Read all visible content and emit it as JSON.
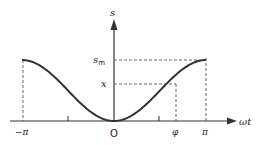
{
  "diagram": {
    "axes": {
      "y_label": "s",
      "x_label": "ωt",
      "origin_label": "O"
    },
    "x_ticks": [
      {
        "label": "−π",
        "pos": -3.14159
      },
      {
        "label": "φ",
        "pos": 2.5
      },
      {
        "label": "π",
        "pos": 3.14159
      }
    ],
    "y_ticks": [
      {
        "label": "s",
        "sub": "m",
        "meaning": "maximum"
      },
      {
        "label": "x",
        "meaning": "value at φ"
      }
    ],
    "curve": {
      "description": "s = s_m (1 − cos ωt)/2 style curve, minimum at 0, peaks at ±π",
      "color": "#333333"
    },
    "colors": {
      "stroke": "#333333",
      "dash": "#555555",
      "background": "#ffffff"
    }
  }
}
